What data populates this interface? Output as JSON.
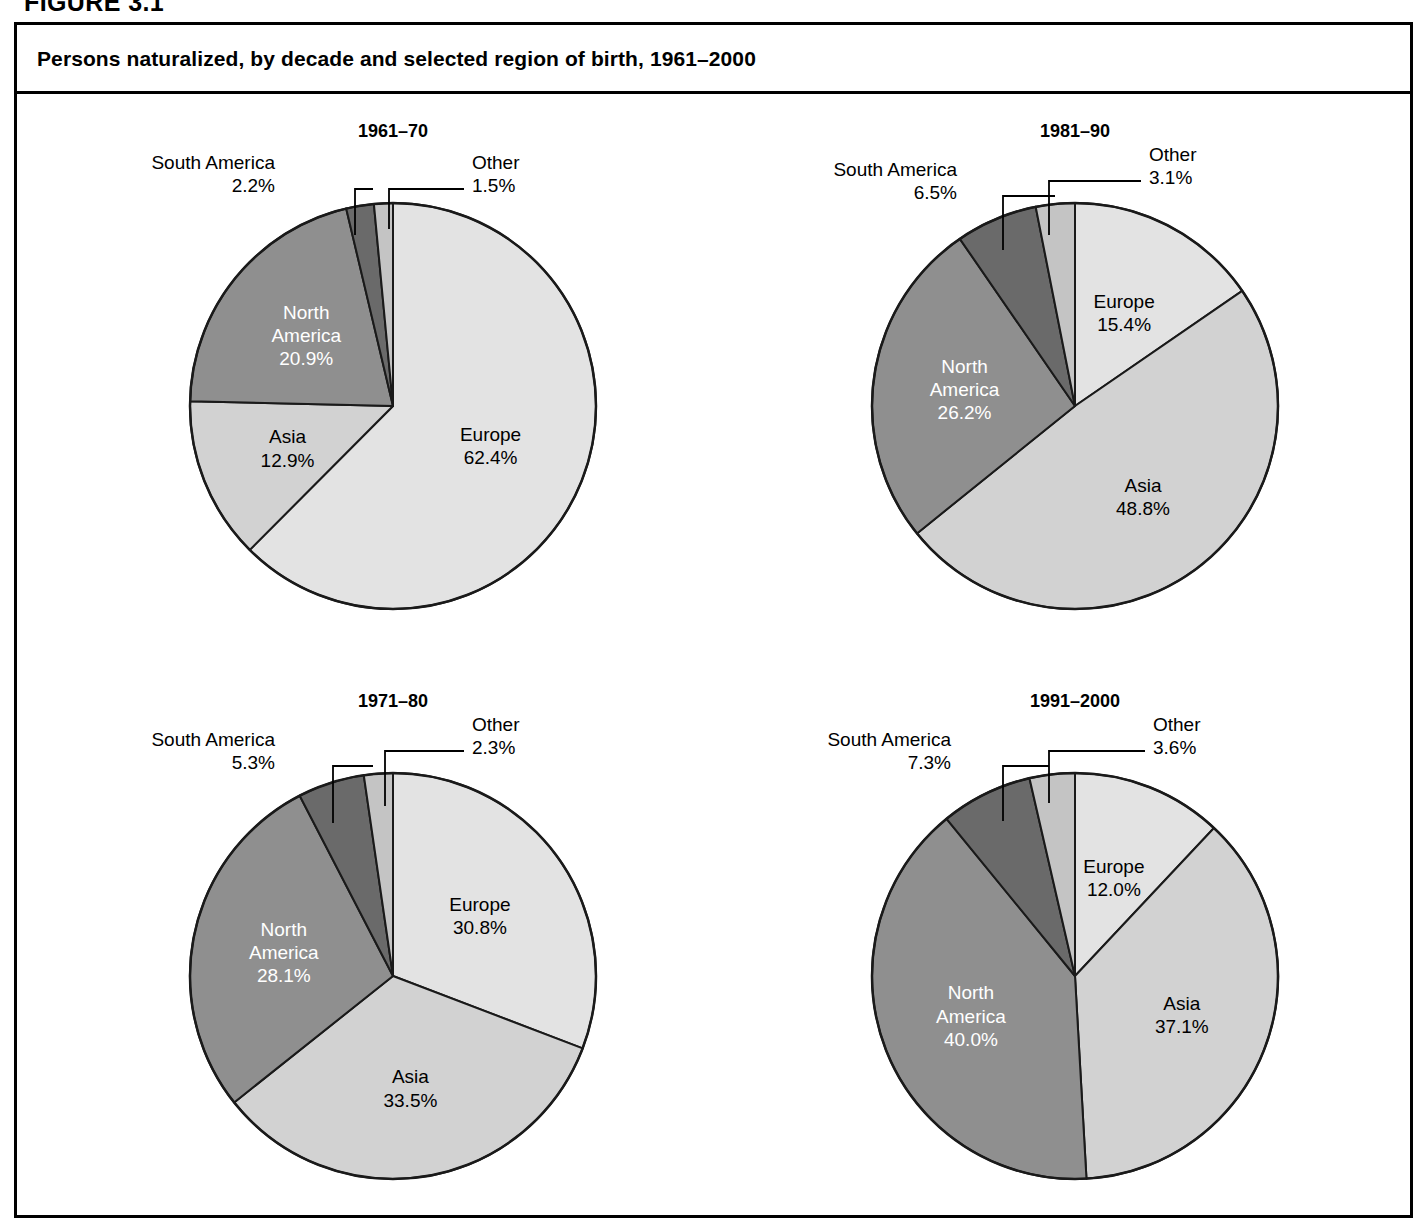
{
  "figure": {
    "label": "FIGURE 3.1",
    "title": "Persons naturalized, by decade and selected region of birth, 1961–2000"
  },
  "colors": {
    "europe": "#e3e3e3",
    "asia": "#d2d2d2",
    "north_america": "#8f8f8f",
    "south_america": "#6a6a6a",
    "other": "#c4c4c4",
    "stroke": "#1a1a1a",
    "frame": "#000000",
    "background": "#ffffff"
  },
  "chart_data": [
    {
      "type": "pie",
      "title": "1961–70",
      "categories": [
        "Europe",
        "Asia",
        "North America",
        "South America",
        "Other"
      ],
      "values": [
        62.4,
        12.9,
        20.9,
        2.2,
        1.5
      ],
      "labels": [
        "62.4%",
        "12.9%",
        "20.9%",
        "2.2%",
        "1.5%"
      ],
      "unit": "percent",
      "start_angle": 0,
      "direction": "clockwise",
      "legend": "none",
      "callouts": [
        {
          "name": "South America",
          "value": "2.2%",
          "side": "left"
        },
        {
          "name": "Other",
          "value": "1.5%",
          "side": "right"
        }
      ],
      "inner_labels": [
        {
          "name": "Europe",
          "value": "62.4%",
          "tone": "dark"
        },
        {
          "name": "Asia",
          "value": "12.9%",
          "tone": "dark"
        },
        {
          "name": "North\nAmerica",
          "value": "20.9%",
          "tone": "light"
        }
      ]
    },
    {
      "type": "pie",
      "title": "1981–90",
      "categories": [
        "Europe",
        "Asia",
        "North America",
        "South America",
        "Other"
      ],
      "values": [
        15.4,
        48.8,
        26.2,
        6.5,
        3.1
      ],
      "labels": [
        "15.4%",
        "48.8%",
        "26.2%",
        "6.5%",
        "3.1%"
      ],
      "unit": "percent",
      "start_angle": 0,
      "direction": "clockwise",
      "legend": "none",
      "callouts": [
        {
          "name": "South America",
          "value": "6.5%",
          "side": "left"
        },
        {
          "name": "Other",
          "value": "3.1%",
          "side": "right"
        }
      ],
      "inner_labels": [
        {
          "name": "Europe",
          "value": "15.4%",
          "tone": "dark"
        },
        {
          "name": "Asia",
          "value": "48.8%",
          "tone": "dark"
        },
        {
          "name": "North\nAmerica",
          "value": "26.2%",
          "tone": "light"
        }
      ]
    },
    {
      "type": "pie",
      "title": "1971–80",
      "categories": [
        "Europe",
        "Asia",
        "North America",
        "South America",
        "Other"
      ],
      "values": [
        30.8,
        33.5,
        28.1,
        5.3,
        2.3
      ],
      "labels": [
        "30.8%",
        "33.5%",
        "28.1%",
        "5.3%",
        "2.3%"
      ],
      "unit": "percent",
      "start_angle": 0,
      "direction": "clockwise",
      "legend": "none",
      "callouts": [
        {
          "name": "South America",
          "value": "5.3%",
          "side": "left"
        },
        {
          "name": "Other",
          "value": "2.3%",
          "side": "right"
        }
      ],
      "inner_labels": [
        {
          "name": "Europe",
          "value": "30.8%",
          "tone": "dark"
        },
        {
          "name": "Asia",
          "value": "33.5%",
          "tone": "dark"
        },
        {
          "name": "North\nAmerica",
          "value": "28.1%",
          "tone": "light"
        }
      ]
    },
    {
      "type": "pie",
      "title": "1991–2000",
      "categories": [
        "Europe",
        "Asia",
        "North America",
        "South America",
        "Other"
      ],
      "values": [
        12.0,
        37.1,
        40.0,
        7.3,
        3.6
      ],
      "labels": [
        "12.0%",
        "37.1%",
        "40.0%",
        "7.3%",
        "3.6%"
      ],
      "unit": "percent",
      "start_angle": 0,
      "direction": "clockwise",
      "legend": "none",
      "callouts": [
        {
          "name": "South America",
          "value": "7.3%",
          "side": "left"
        },
        {
          "name": "Other",
          "value": "3.6%",
          "side": "right"
        }
      ],
      "inner_labels": [
        {
          "name": "Europe",
          "value": "12.0%",
          "tone": "dark"
        },
        {
          "name": "Asia",
          "value": "37.1%",
          "tone": "dark"
        },
        {
          "name": "North\nAmerica",
          "value": "40.0%",
          "tone": "light"
        }
      ]
    }
  ],
  "panels": [
    {
      "title_x": 390,
      "title_y": 118,
      "cx": 390,
      "cy": 403,
      "r": 203,
      "sa_label_x": 272,
      "sa_label_y": 148,
      "sa_line_x": 272,
      "sa_elbow_x": 352,
      "sa_line_y": 186,
      "sa_drop_y": 232,
      "ot_label_x": 469,
      "ot_label_y": 148,
      "ot_elbow_x": 386,
      "ot_line_y": 186,
      "ot_drop_y": 226
    },
    {
      "title_x": 1072,
      "title_y": 118,
      "cx": 1072,
      "cy": 403,
      "r": 203,
      "sa_label_x": 954,
      "sa_label_y": 155,
      "sa_line_x": 954,
      "sa_elbow_x": 1000,
      "sa_line_y": 193,
      "sa_drop_y": 247,
      "ot_label_x": 1146,
      "ot_label_y": 140,
      "ot_elbow_x": 1046,
      "ot_line_y": 178,
      "ot_drop_y": 232
    },
    {
      "title_x": 390,
      "title_y": 688,
      "cx": 390,
      "cy": 973,
      "r": 203,
      "sa_label_x": 272,
      "sa_label_y": 725,
      "sa_line_x": 272,
      "sa_elbow_x": 330,
      "sa_line_y": 763,
      "sa_drop_y": 820,
      "ot_label_x": 469,
      "ot_label_y": 710,
      "ot_elbow_x": 382,
      "ot_line_y": 748,
      "ot_drop_y": 803
    },
    {
      "title_x": 1072,
      "title_y": 688,
      "cx": 1072,
      "cy": 973,
      "r": 203,
      "sa_label_x": 948,
      "sa_label_y": 725,
      "sa_line_x": 948,
      "sa_elbow_x": 1000,
      "sa_line_y": 763,
      "sa_drop_y": 818,
      "ot_label_x": 1150,
      "ot_label_y": 710,
      "ot_elbow_x": 1046,
      "ot_line_y": 748,
      "ot_drop_y": 800
    }
  ]
}
